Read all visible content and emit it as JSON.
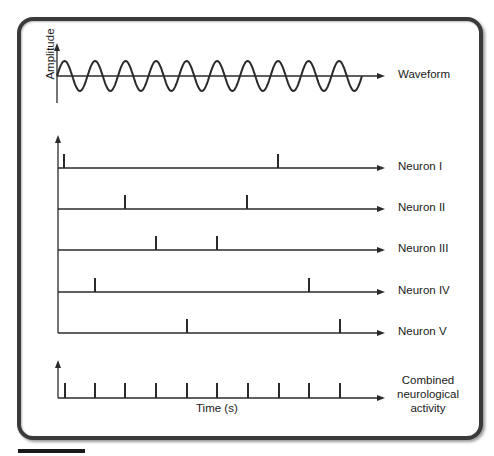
{
  "diagram": {
    "waveform": {
      "y_axis_label": "Amplitude",
      "label": "Waveform",
      "cycles": 10,
      "x_start": 57,
      "x_end": 362,
      "baseline_y": 76,
      "amplitude_px": 15
    },
    "neurons": [
      {
        "label": "Neuron I",
        "baseline_y": 168,
        "spikes_x": [
          64,
          278
        ]
      },
      {
        "label": "Neuron II",
        "baseline_y": 209,
        "spikes_x": [
          125,
          247
        ]
      },
      {
        "label": "Neuron III",
        "baseline_y": 250,
        "spikes_x": [
          156,
          217
        ]
      },
      {
        "label": "Neuron IV",
        "baseline_y": 292,
        "spikes_x": [
          95,
          309
        ]
      },
      {
        "label": "Neuron V",
        "baseline_y": 333,
        "spikes_x": [
          187,
          340
        ]
      }
    ],
    "combined": {
      "label_lines": [
        "Combined",
        "neurological",
        "activity"
      ],
      "baseline_y": 398,
      "spikes_x": [
        65,
        95,
        125,
        156,
        187,
        217,
        248,
        279,
        309,
        340
      ]
    },
    "x_axis_label": "Time (s)",
    "colors": {
      "line": "#2a2a2a",
      "frame": "#3a3a3a",
      "text": "#1a1a1a"
    }
  }
}
